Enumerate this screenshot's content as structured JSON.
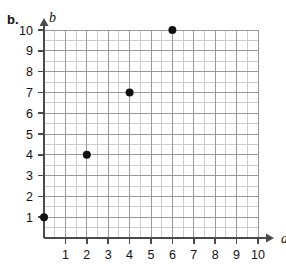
{
  "figure": {
    "part_label": "b.",
    "type": "scatter-plot-grid"
  },
  "chart_data": {
    "type": "scatter",
    "title": "",
    "subtitle": "",
    "xlabel": "a",
    "ylabel": "b",
    "xlim": [
      0,
      10
    ],
    "ylim": [
      0,
      10
    ],
    "grid": true,
    "minor_grid": true,
    "minor_divisions_per_unit": 2,
    "legend": "none",
    "x_tick_labels": [
      "1",
      "2",
      "3",
      "4",
      "5",
      "6",
      "7",
      "8",
      "9",
      "10"
    ],
    "y_tick_labels": [
      "1",
      "2",
      "3",
      "4",
      "5",
      "6",
      "7",
      "8",
      "9",
      "10"
    ],
    "x_ticks": [
      1,
      2,
      3,
      4,
      5,
      6,
      7,
      8,
      9,
      10
    ],
    "y_ticks": [
      1,
      2,
      3,
      4,
      5,
      6,
      7,
      8,
      9,
      10
    ],
    "points": [
      {
        "x": 0,
        "y": 1,
        "label": "(0, 1)"
      },
      {
        "x": 2,
        "y": 4,
        "label": "(2, 4)"
      },
      {
        "x": 4,
        "y": 7,
        "label": "(4, 7)"
      },
      {
        "x": 6,
        "y": 10,
        "label": "(6, 10)"
      }
    ],
    "point_color": "#111111",
    "point_radius": 4,
    "major_gridline_color": "#9a9a9a",
    "minor_gridline_color": "#cccccc",
    "axis_color": "#4a4a4a",
    "axis_arrow": true
  }
}
